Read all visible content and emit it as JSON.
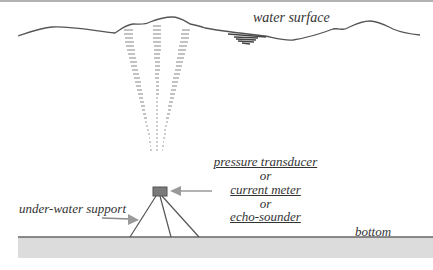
{
  "diagram": {
    "labels": {
      "water_surface": "water surface",
      "pressure_transducer": "pressure transducer",
      "or_1": "or",
      "current_meter": "current meter",
      "or_2": "or",
      "echo_sounder": "echo-sounder",
      "under_water_support": "under-water support",
      "bottom": "bottom"
    },
    "colors": {
      "line": "#555555",
      "instrument_fill": "#7a7a7a",
      "seabed_fill": "#d9d9d9",
      "arrow": "#8a8a8a",
      "beam_dash": "#9a9a9a",
      "text": "#333333"
    }
  }
}
